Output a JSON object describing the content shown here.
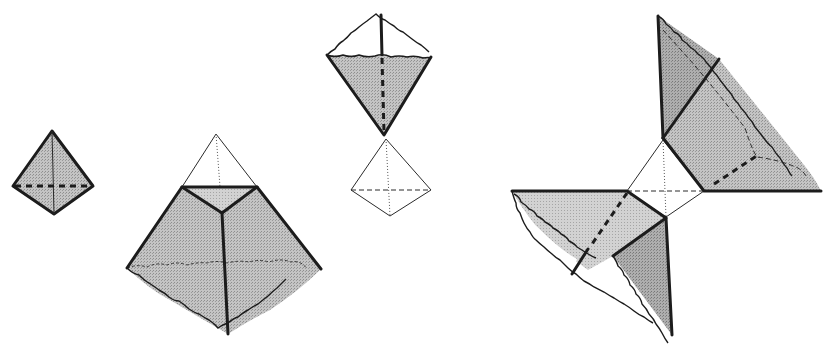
{
  "diagram": {
    "colors": {
      "background": "#ffffff",
      "face_fill": "#bdbdbd",
      "face_fill_dark": "#a9a9a9",
      "face_fill_light": "#c9c9c9",
      "edge": "#1c1c1c",
      "wire": "#2a2a2a"
    },
    "figures": [
      {
        "id": "small-tetrahedron",
        "label": "",
        "bbox": [
          12,
          130,
          94,
          214
        ]
      },
      {
        "id": "truncated-tetrahedron",
        "label": "",
        "bbox": [
          125,
          133,
          323,
          335
        ]
      },
      {
        "id": "inverted-cut-tetrahedron-with-wireframe",
        "label": "",
        "bbox": [
          325,
          14,
          432,
          218
        ]
      },
      {
        "id": "pinwheel-unfolding",
        "label": "",
        "bbox": [
          510,
          15,
          822,
          338
        ]
      }
    ]
  }
}
